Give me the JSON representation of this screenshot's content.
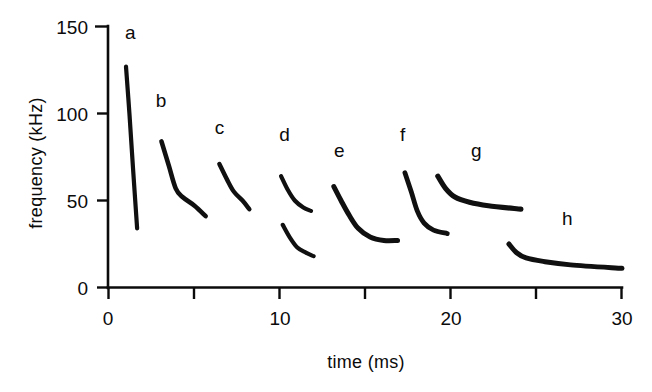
{
  "chart_data": {
    "type": "line",
    "title": "",
    "xlabel": "time  (ms)",
    "ylabel": "frequency  (kHz)",
    "xlim": [
      0,
      30
    ],
    "ylim": [
      0,
      150
    ],
    "xticks": [
      0,
      5,
      10,
      15,
      20,
      25,
      30
    ],
    "xtick_labels": [
      "0",
      "",
      "10",
      "",
      "20",
      "",
      "30"
    ],
    "yticks": [
      0,
      50,
      100,
      150
    ],
    "ytick_labels": [
      "0",
      "50",
      "100",
      "150"
    ],
    "grid": false,
    "legend": "none",
    "annotations": [
      {
        "text": "a",
        "x": 1.3,
        "y": 143
      },
      {
        "text": "b",
        "x": 3.1,
        "y": 104
      },
      {
        "text": "c",
        "x": 6.5,
        "y": 88
      },
      {
        "text": "d",
        "x": 10.3,
        "y": 84
      },
      {
        "text": "e",
        "x": 13.5,
        "y": 75
      },
      {
        "text": "f",
        "x": 17.2,
        "y": 84
      },
      {
        "text": "g",
        "x": 21.5,
        "y": 75
      },
      {
        "text": "h",
        "x": 26.8,
        "y": 36
      }
    ],
    "series": [
      {
        "name": "a",
        "points": [
          [
            1.05,
            127
          ],
          [
            1.25,
            100
          ],
          [
            1.45,
            70
          ],
          [
            1.7,
            34
          ]
        ]
      },
      {
        "name": "b",
        "points": [
          [
            3.12,
            84
          ],
          [
            3.55,
            70
          ],
          [
            3.95,
            57
          ],
          [
            4.35,
            52
          ],
          [
            5.05,
            47
          ],
          [
            5.7,
            41
          ]
        ]
      },
      {
        "name": "c",
        "points": [
          [
            6.5,
            71
          ],
          [
            6.95,
            62
          ],
          [
            7.35,
            55
          ],
          [
            7.85,
            50
          ],
          [
            8.25,
            45
          ]
        ]
      },
      {
        "name": "d-upper",
        "points": [
          [
            10.1,
            64
          ],
          [
            10.5,
            56
          ],
          [
            10.9,
            50
          ],
          [
            11.4,
            46
          ],
          [
            11.85,
            44
          ]
        ]
      },
      {
        "name": "d-lower",
        "points": [
          [
            10.2,
            36
          ],
          [
            10.6,
            29
          ],
          [
            11.05,
            23
          ],
          [
            11.55,
            20
          ],
          [
            12.0,
            18
          ]
        ]
      },
      {
        "name": "e",
        "points": [
          [
            13.18,
            58
          ],
          [
            13.6,
            50
          ],
          [
            14.05,
            42
          ],
          [
            14.6,
            34
          ],
          [
            15.3,
            29
          ],
          [
            16.1,
            27
          ],
          [
            16.9,
            27
          ]
        ]
      },
      {
        "name": "f",
        "points": [
          [
            17.33,
            66
          ],
          [
            17.7,
            55
          ],
          [
            18.05,
            44
          ],
          [
            18.45,
            37
          ],
          [
            19.0,
            33
          ],
          [
            19.8,
            31
          ]
        ]
      },
      {
        "name": "g",
        "points": [
          [
            19.25,
            64
          ],
          [
            19.7,
            57
          ],
          [
            20.25,
            52
          ],
          [
            21.1,
            49
          ],
          [
            22.2,
            47
          ],
          [
            24.1,
            45
          ]
        ]
      },
      {
        "name": "h",
        "points": [
          [
            23.4,
            25
          ],
          [
            23.85,
            20
          ],
          [
            24.4,
            17
          ],
          [
            25.4,
            15
          ],
          [
            27.0,
            13
          ],
          [
            30.0,
            11
          ]
        ]
      }
    ]
  },
  "axes": {
    "y_title": "frequency  (kHz)",
    "x_title": "time  (ms)",
    "y_labels": [
      "150",
      "100",
      "50",
      "0"
    ],
    "x_labels": [
      "0",
      "10",
      "20",
      "30"
    ]
  },
  "curve_labels": {
    "a": "a",
    "b": "b",
    "c": "c",
    "d": "d",
    "e": "e",
    "f": "f",
    "g": "g",
    "h": "h"
  }
}
